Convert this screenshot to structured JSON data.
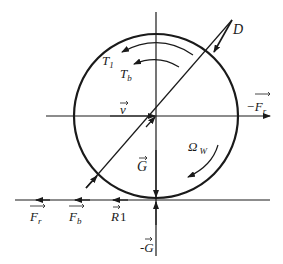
{
  "diagram": {
    "colors": {
      "stroke": "#1a1a1a",
      "background": "#ffffff"
    },
    "wheel": {
      "cx": 156,
      "cy": 116,
      "r": 82
    },
    "labels": {
      "D": "D",
      "T1": "T",
      "T1_sub": "1",
      "Tb": "T",
      "Tb_sub": "b",
      "v": "v",
      "neg_Fr": "−F",
      "neg_Fr_sub": "r",
      "G": "G",
      "Omega_w": "Ω",
      "Omega_w_sub": "W",
      "Fr": "F",
      "Fr_sub": "r",
      "Fb": "F",
      "Fb_sub": "b",
      "R1": "R",
      "R1_sub": "1",
      "neg_G": "-G"
    }
  }
}
